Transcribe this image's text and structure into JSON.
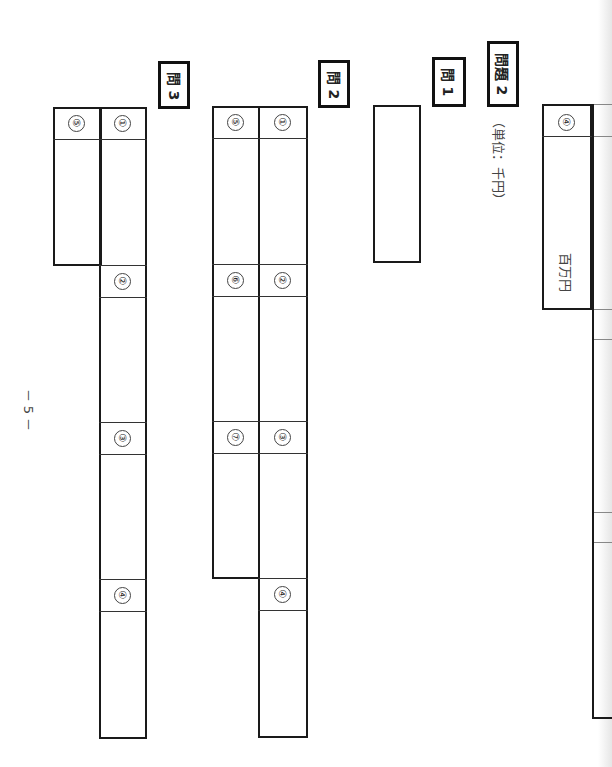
{
  "header": {
    "problem_label": "問題 2",
    "unit_note": "（単位：千円）"
  },
  "prev_section": {
    "cell_number": "④",
    "unit": "百万円"
  },
  "q1": {
    "label": "問 1"
  },
  "q2": {
    "label": "問 2",
    "cells": [
      "①",
      "②",
      "③",
      "④",
      "⑤",
      "⑥",
      "⑦"
    ]
  },
  "q3": {
    "label": "問 3",
    "cells": [
      "①",
      "②",
      "③",
      "④",
      "⑤"
    ]
  },
  "footer": {
    "page_number": "－ 5 －"
  }
}
